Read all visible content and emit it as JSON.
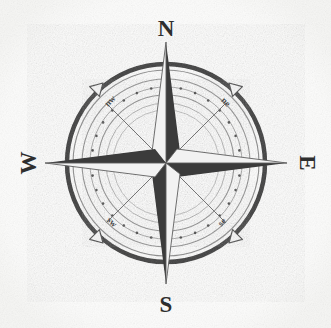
{
  "figure": {
    "background_color": "#fdfdfd",
    "center": {
      "x": 166,
      "y": 163
    },
    "ink_color_dark": "#3a3a3a",
    "ink_color_mid": "#6e6e6e",
    "ink_color_light": "#d8d8d8",
    "paper_tone": "#f4f4f2"
  },
  "cardinal_points": [
    {
      "name": "north",
      "label": "N",
      "bearing_deg": 0,
      "label_x": 166,
      "label_y": 30,
      "rotation": 0
    },
    {
      "name": "east",
      "label": "E",
      "bearing_deg": 90,
      "label_x": 306,
      "label_y": 163,
      "rotation": 90
    },
    {
      "name": "south",
      "label": "S",
      "bearing_deg": 180,
      "label_x": 166,
      "label_y": 307,
      "rotation": 0
    },
    {
      "name": "west",
      "label": "W",
      "bearing_deg": 270,
      "label_x": 28,
      "label_y": 163,
      "rotation": -90
    }
  ],
  "ordinal_points": [
    {
      "name": "northwest",
      "label": "nw",
      "bearing_deg": 315,
      "label_x": 112,
      "label_y": 103,
      "rotation": -45
    },
    {
      "name": "northeast",
      "label": "ne",
      "bearing_deg": 45,
      "label_x": 224,
      "label_y": 104,
      "rotation": 45
    },
    {
      "name": "southeast",
      "label": "se",
      "bearing_deg": 135,
      "label_x": 224,
      "label_y": 224,
      "rotation": -45
    },
    {
      "name": "southwest",
      "label": "sw",
      "bearing_deg": 225,
      "label_x": 110,
      "label_y": 224,
      "rotation": 45
    }
  ],
  "rings": [
    {
      "name": "outer-heavy-ring",
      "radius": 99,
      "stroke_width": 4.5,
      "color": "#3f3f3f",
      "style": "solid"
    },
    {
      "name": "outer-thin-ring",
      "radius": 93,
      "stroke_width": 1.0,
      "color": "#808080",
      "style": "solid"
    },
    {
      "name": "scale-ring-outer",
      "radius": 84,
      "stroke_width": 1.0,
      "color": "#8a8a8a",
      "style": "solid"
    },
    {
      "name": "dotted-degree-ring",
      "radius": 76,
      "stroke_width": 1.0,
      "color": "#9a9a9a",
      "style": "solid"
    },
    {
      "name": "scale-ring-inner",
      "radius": 68,
      "stroke_width": 1.0,
      "color": "#8a8a8a",
      "style": "solid"
    },
    {
      "name": "inner-hairline-ring",
      "radius": 60,
      "stroke_width": 0.9,
      "color": "#a0a0a0",
      "style": "solid"
    },
    {
      "name": "innermost-ring",
      "radius": 53,
      "stroke_width": 0.9,
      "color": "#b0b0b0",
      "style": "solid"
    }
  ],
  "degree_dots": {
    "name": "degree-marker-dots",
    "ring_radius": 76,
    "count": 32,
    "dot_radius": 1.3,
    "color": "#4a4a4a"
  },
  "star": {
    "name": "eight-point-star",
    "major_points": [
      {
        "name": "star-point-north",
        "bearing_deg": 0,
        "length": 124,
        "half_width": 15
      },
      {
        "name": "star-point-east",
        "bearing_deg": 90,
        "length": 124,
        "half_width": 15
      },
      {
        "name": "star-point-south",
        "bearing_deg": 180,
        "length": 124,
        "half_width": 15
      },
      {
        "name": "star-point-west",
        "bearing_deg": 270,
        "length": 124,
        "half_width": 15
      }
    ],
    "minor_points": [
      {
        "name": "star-point-northeast",
        "bearing_deg": 45,
        "length": 84,
        "half_width": 12
      },
      {
        "name": "star-point-southeast",
        "bearing_deg": 135,
        "length": 84,
        "half_width": 12
      },
      {
        "name": "star-point-southwest",
        "bearing_deg": 225,
        "length": 84,
        "half_width": 12
      },
      {
        "name": "star-point-northwest",
        "bearing_deg": 315,
        "length": 84,
        "half_width": 12
      }
    ],
    "shading": "each point split lengthwise: clockwise half dark, counter-clockwise half light"
  },
  "arrow_tips": [
    {
      "name": "arrow-tip-northwest",
      "bearing_deg": 315,
      "radius": 99,
      "size": 9
    },
    {
      "name": "arrow-tip-northeast",
      "bearing_deg": 45,
      "radius": 99,
      "size": 9
    },
    {
      "name": "arrow-tip-southeast",
      "bearing_deg": 135,
      "radius": 99,
      "size": 9
    },
    {
      "name": "arrow-tip-southwest",
      "bearing_deg": 225,
      "radius": 99,
      "size": 9
    }
  ]
}
